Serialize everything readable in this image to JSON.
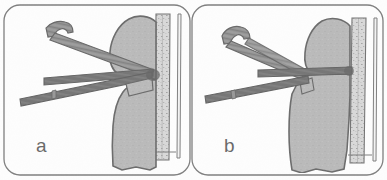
{
  "figure": {
    "kind": "surgical-technique-illustration",
    "panel_count": 2,
    "background_color": "#fdfdfd",
    "frame_color": "#4a4a4a",
    "bone_fill_color": "#9e9e9e",
    "bone_outline_color": "#2f2f2f",
    "instrument_fill_color": "#5d5d5d",
    "instrument_dark_color": "#343434",
    "cortical_strip_color": "#c7c7c7",
    "label_color": "#2b2b2b"
  },
  "panels": [
    {
      "id": "a",
      "label": "a",
      "label_x": 36,
      "label_y": 152,
      "frame": {
        "x": 4,
        "y": 5,
        "width": 186,
        "height": 170,
        "radius": 16
      },
      "parts": [
        {
          "name": "humeral-head-and-shaft",
          "kind": "bone"
        },
        {
          "name": "cortical-strip",
          "kind": "bone-graft"
        },
        {
          "name": "hook-retractor",
          "kind": "instrument"
        },
        {
          "name": "upper-reduction-rod",
          "kind": "instrument"
        },
        {
          "name": "lower-reduction-rod",
          "kind": "instrument"
        }
      ]
    },
    {
      "id": "b",
      "label": "b",
      "label_x": 224,
      "label_y": 152,
      "frame": {
        "x": 192,
        "y": 5,
        "width": 191,
        "height": 170,
        "radius": 16
      },
      "parts": [
        {
          "name": "humeral-head-and-shaft",
          "kind": "bone"
        },
        {
          "name": "cortical-strip",
          "kind": "bone-graft"
        },
        {
          "name": "hook-retractor",
          "kind": "instrument"
        },
        {
          "name": "upper-reduction-rod",
          "kind": "instrument"
        },
        {
          "name": "lower-reduction-rod",
          "kind": "instrument"
        }
      ]
    }
  ]
}
